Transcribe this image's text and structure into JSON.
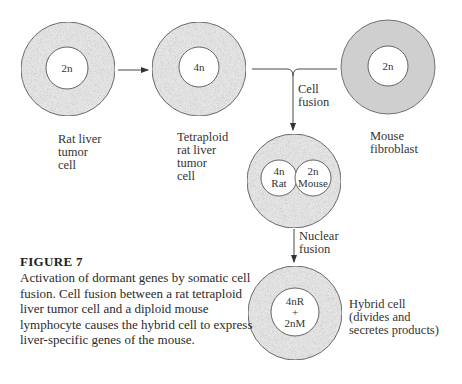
{
  "figure": {
    "title": "FIGURE 7",
    "caption": "Activation of dormant genes by somatic cell fusion. Cell fusion between a rat tetraploid liver tumor cell and a diploid mouse lymphocyte causes the hybrid cell to express liver-specific genes of the mouse."
  },
  "cells": [
    {
      "id": "rat-liver-tumor-cell",
      "nucleus": "2n",
      "label": "Rat liver\ntumor\ncell"
    },
    {
      "id": "tetraploid-rat-liver-tumor-cell",
      "nucleus": "4n",
      "label": "Tetraploid\nrat liver\ntumor\ncell"
    },
    {
      "id": "mouse-fibroblast",
      "nucleus": "2n",
      "label": "Mouse\nfibroblast"
    },
    {
      "id": "fused-cell",
      "nuclei": [
        {
          "line1": "4n",
          "line2": "Rat"
        },
        {
          "line1": "2n",
          "line2": "Mouse"
        }
      ]
    },
    {
      "id": "hybrid-cell",
      "nucleus_lines": [
        "4nR",
        "+",
        "2nM"
      ],
      "label": "Hybrid cell\n(divides and\nsecretes products)"
    }
  ],
  "arrows": {
    "cell_fusion": "Cell\nfusion",
    "nuclear_fusion": "Nuclear\nfusion"
  },
  "colors": {
    "cytoplasm_stipple": "#d4d4d4",
    "cytoplasm_solid": "#cfcfcf",
    "outline": "#555555",
    "nucleus": "#ffffff"
  }
}
